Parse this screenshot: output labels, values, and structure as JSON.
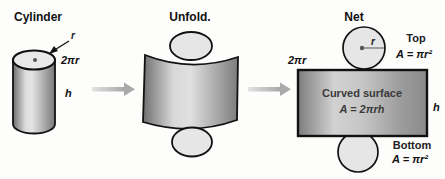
{
  "figure": {
    "sections": {
      "cylinder": {
        "title": "Cylinder",
        "labels": {
          "radius": "r",
          "circumference": "2πr",
          "height": "h"
        }
      },
      "unfold": {
        "title": "Unfold."
      },
      "net": {
        "title": "Net",
        "labels": {
          "circumference": "2πr",
          "radius": "r",
          "height": "h",
          "top_caption": "Top",
          "top_area": "A = πr²",
          "curved_caption": "Curved surface",
          "curved_area": "A = 2πrh",
          "bottom_caption": "Bottom",
          "bottom_area": "A = πr²"
        }
      }
    },
    "colors": {
      "background": "#fdfdfc",
      "outline": "#111111",
      "shade_dark": "#757575",
      "shade_light": "#dedede",
      "disc_fill": "#e6e6e6",
      "flow_arrow": "#bdbdbd",
      "inner_text": "#3a3a3a"
    }
  }
}
